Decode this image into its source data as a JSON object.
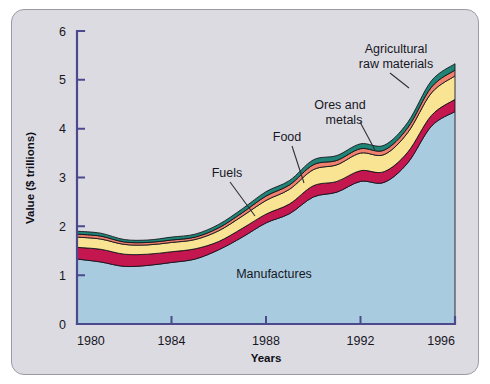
{
  "figure": {
    "background_color": "#dddbe2",
    "border_color": "#9c9aa4",
    "axis_color": "#4c4a8c"
  },
  "axes": {
    "x_title": "Years",
    "y_title": "Value ($ trillions)",
    "x_ticks": [
      "1980",
      "1984",
      "1988",
      "1992",
      "1996"
    ],
    "y_ticks": [
      "0",
      "1",
      "2",
      "3",
      "4",
      "5",
      "6"
    ]
  },
  "labels": {
    "manufactures": "Manufactures",
    "fuels": "Fuels",
    "food": "Food",
    "ores_and_metals": "Ores and\nmetals",
    "ores_and_metals_line1": "Ores and",
    "ores_and_metals_line2": "metals",
    "agricultural_line1": "Agricultural",
    "agricultural_line2": "raw materials"
  },
  "chart_data": {
    "type": "area",
    "title": "",
    "subtitle": "",
    "xlabel": "Years",
    "ylabel": "Value ($ trillions)",
    "xlim": [
      1980,
      1996
    ],
    "ylim": [
      0,
      6
    ],
    "grid": false,
    "legend_position": "inline-annotations",
    "stacked": true,
    "x": [
      1980,
      1981,
      1982,
      1983,
      1984,
      1985,
      1986,
      1987,
      1988,
      1989,
      1990,
      1991,
      1992,
      1993,
      1994,
      1995,
      1996
    ],
    "series": [
      {
        "name": "Manufactures",
        "color": "#a9cbe0",
        "values": [
          1.33,
          1.27,
          1.18,
          1.2,
          1.26,
          1.33,
          1.52,
          1.78,
          2.07,
          2.26,
          2.6,
          2.7,
          2.92,
          2.9,
          3.3,
          4.05,
          4.35
        ]
      },
      {
        "name": "Fuels",
        "color": "#c4164f",
        "values": [
          0.24,
          0.26,
          0.25,
          0.23,
          0.22,
          0.21,
          0.17,
          0.18,
          0.18,
          0.2,
          0.23,
          0.22,
          0.22,
          0.22,
          0.22,
          0.22,
          0.25
        ]
      },
      {
        "name": "Food",
        "color": "#f8e493",
        "values": [
          0.21,
          0.21,
          0.2,
          0.19,
          0.19,
          0.19,
          0.22,
          0.25,
          0.28,
          0.3,
          0.33,
          0.34,
          0.36,
          0.35,
          0.4,
          0.46,
          0.48
        ]
      },
      {
        "name": "Ores and metals",
        "color": "#f0806e",
        "values": [
          0.06,
          0.06,
          0.05,
          0.05,
          0.05,
          0.05,
          0.06,
          0.07,
          0.09,
          0.09,
          0.1,
          0.09,
          0.09,
          0.09,
          0.1,
          0.12,
          0.12
        ]
      },
      {
        "name": "Agricultural raw materials",
        "color": "#1f8476",
        "values": [
          0.06,
          0.06,
          0.05,
          0.05,
          0.06,
          0.06,
          0.07,
          0.08,
          0.09,
          0.09,
          0.1,
          0.1,
          0.1,
          0.1,
          0.11,
          0.13,
          0.13
        ]
      }
    ]
  }
}
